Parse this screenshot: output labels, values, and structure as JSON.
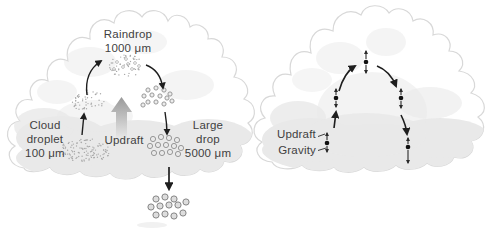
{
  "figure": {
    "width": 498,
    "height": 231,
    "background": "#ffffff",
    "palette": {
      "text": "#3f3f3f",
      "arrow": "#1e1e1e",
      "cloud_outline": "#d8d8d8",
      "cloud_fill": "#ffffff",
      "cloud_shade": "#e9e9e9",
      "drop_ring": "#8f8f8f",
      "stipple": "#a9a9a9",
      "updraft_arrow_dark": "#999999",
      "updraft_arrow_light": "#ededed"
    }
  },
  "left_diagram": {
    "labels": {
      "raindrop": {
        "name": "Raindrop",
        "size": "1000 μm"
      },
      "cloud_droplet": {
        "line1": "Cloud",
        "line2": "droplet",
        "size": "100 μm"
      },
      "updraft": {
        "name": "Updraft"
      },
      "large_drop": {
        "line1": "Large",
        "line2": "drop",
        "size": "5000 μm"
      }
    }
  },
  "right_diagram": {
    "labels": {
      "updraft": "Updraft",
      "gravity": "Gravity"
    }
  }
}
